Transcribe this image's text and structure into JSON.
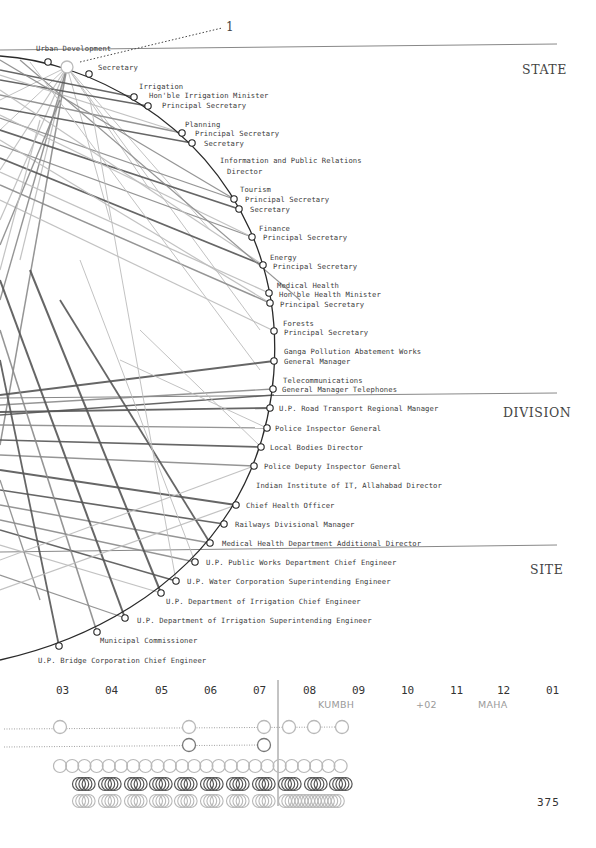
{
  "callout": {
    "number": "1"
  },
  "tiers": [
    {
      "label": "STATE",
      "x": 522,
      "y": 62
    },
    {
      "label": "DIVISION",
      "x": 503,
      "y": 405
    },
    {
      "label": "SITE",
      "x": 530,
      "y": 562
    }
  ],
  "tier_dividers": [
    {
      "x1": 0,
      "y1": 50,
      "x2": 557,
      "y2": 44
    },
    {
      "x1": 0,
      "y1": 398,
      "x2": 557,
      "y2": 393
    },
    {
      "x1": 0,
      "y1": 552,
      "x2": 557,
      "y2": 545
    }
  ],
  "nodes": [
    {
      "id": "urban_dev",
      "x": 48,
      "y": 62
    },
    {
      "id": "focus",
      "x": 67,
      "y": 67,
      "r": 6,
      "focus": true
    },
    {
      "id": "urban_sec",
      "x": 89,
      "y": 74
    },
    {
      "id": "irr_min",
      "x": 134,
      "y": 97
    },
    {
      "id": "irr_ps",
      "x": 148,
      "y": 106
    },
    {
      "id": "plan_ps",
      "x": 182,
      "y": 133
    },
    {
      "id": "plan_sec",
      "x": 192,
      "y": 143
    },
    {
      "id": "tour_ps",
      "x": 234,
      "y": 199
    },
    {
      "id": "tour_sec",
      "x": 239,
      "y": 209
    },
    {
      "id": "fin_ps",
      "x": 252,
      "y": 237
    },
    {
      "id": "energy_ps",
      "x": 263,
      "y": 265
    },
    {
      "id": "health_min",
      "x": 269,
      "y": 293
    },
    {
      "id": "health_ps",
      "x": 270,
      "y": 303
    },
    {
      "id": "forest_ps",
      "x": 274,
      "y": 331
    },
    {
      "id": "ganga_gm",
      "x": 274,
      "y": 361
    },
    {
      "id": "telecom_gm",
      "x": 273,
      "y": 389
    },
    {
      "id": "road",
      "x": 270,
      "y": 408
    },
    {
      "id": "police_ig",
      "x": 267,
      "y": 428
    },
    {
      "id": "local",
      "x": 261,
      "y": 447
    },
    {
      "id": "police_dig",
      "x": 254,
      "y": 466
    },
    {
      "id": "chief_health",
      "x": 236,
      "y": 505
    },
    {
      "id": "railways",
      "x": 224,
      "y": 524
    },
    {
      "id": "med_add",
      "x": 210,
      "y": 543
    },
    {
      "id": "pwd",
      "x": 195,
      "y": 562
    },
    {
      "id": "water",
      "x": 176,
      "y": 581
    },
    {
      "id": "irr_ce",
      "x": 161,
      "y": 593
    },
    {
      "id": "irr_se",
      "x": 125,
      "y": 618
    },
    {
      "id": "municipal",
      "x": 97,
      "y": 632
    },
    {
      "id": "bridge",
      "x": 59,
      "y": 646
    }
  ],
  "labels": [
    {
      "text": "Urban Development",
      "x": 36,
      "y": 44
    },
    {
      "text": "Secretary",
      "x": 98,
      "y": 63
    },
    {
      "text": "Irrigation",
      "x": 139,
      "y": 82
    },
    {
      "text": "Hon'ble Irrigation Minister",
      "x": 149,
      "y": 91
    },
    {
      "text": "Principal Secretary",
      "x": 162,
      "y": 101
    },
    {
      "text": "Planning",
      "x": 185,
      "y": 120
    },
    {
      "text": "Principal Secretary",
      "x": 195,
      "y": 129
    },
    {
      "text": "Secretary",
      "x": 204,
      "y": 139
    },
    {
      "text": "Information and Public Relations",
      "x": 220,
      "y": 156
    },
    {
      "text": "Director",
      "x": 227,
      "y": 167
    },
    {
      "text": "Tourism",
      "x": 240,
      "y": 185
    },
    {
      "text": "Principal Secretary",
      "x": 245,
      "y": 195
    },
    {
      "text": "Secretary",
      "x": 250,
      "y": 205
    },
    {
      "text": "Finance",
      "x": 259,
      "y": 224
    },
    {
      "text": "Principal Secretary",
      "x": 263,
      "y": 233
    },
    {
      "text": "Energy",
      "x": 270,
      "y": 253
    },
    {
      "text": "Principal Secretary",
      "x": 273,
      "y": 262
    },
    {
      "text": "Medical Health",
      "x": 277,
      "y": 281
    },
    {
      "text": "Hon'ble Health Minister",
      "x": 279,
      "y": 290
    },
    {
      "text": "Principal Secretary",
      "x": 280,
      "y": 300
    },
    {
      "text": "Forests",
      "x": 283,
      "y": 319
    },
    {
      "text": "Principal Secretary",
      "x": 284,
      "y": 328
    },
    {
      "text": "Ganga Pollution Abatement Works",
      "x": 284,
      "y": 347
    },
    {
      "text": "General Manager",
      "x": 284,
      "y": 357
    },
    {
      "text": "Telecommunications",
      "x": 283,
      "y": 376
    },
    {
      "text": "General Manager Telephones",
      "x": 282,
      "y": 385
    },
    {
      "text": "U.P. Road Transport Regional Manager",
      "x": 279,
      "y": 404
    },
    {
      "text": "Police Inspector General",
      "x": 275,
      "y": 424
    },
    {
      "text": "Local Bodies Director",
      "x": 270,
      "y": 443
    },
    {
      "text": "Police Deputy Inspector General",
      "x": 264,
      "y": 462
    },
    {
      "text": "Indian Institute of IT, Allahabad Director",
      "x": 256,
      "y": 481
    },
    {
      "text": "Chief Health Officer",
      "x": 246,
      "y": 501
    },
    {
      "text": "Railways Divisional Manager",
      "x": 235,
      "y": 520
    },
    {
      "text": "Medical Health Department Additional Director",
      "x": 222,
      "y": 539
    },
    {
      "text": "U.P. Public Works Department Chief Engineer",
      "x": 206,
      "y": 558
    },
    {
      "text": "U.P. Water Corporation Superintending Engineer",
      "x": 187,
      "y": 577
    },
    {
      "text": "U.P. Department of Irrigation Chief Engineer",
      "x": 166,
      "y": 597
    },
    {
      "text": "U.P. Department of Irrigation Superintending Engineer",
      "x": 137,
      "y": 616
    },
    {
      "text": "Municipal Commissioner",
      "x": 100,
      "y": 636
    },
    {
      "text": "U.P. Bridge Corporation Chief Engineer",
      "x": 38,
      "y": 656
    }
  ],
  "timeline": {
    "years": [
      {
        "label": "03",
        "x": 56
      },
      {
        "label": "04",
        "x": 105
      },
      {
        "label": "05",
        "x": 155
      },
      {
        "label": "06",
        "x": 204
      },
      {
        "label": "07",
        "x": 253
      },
      {
        "label": "08",
        "x": 303
      },
      {
        "label": "09",
        "x": 352
      },
      {
        "label": "10",
        "x": 401
      },
      {
        "label": "11",
        "x": 450
      },
      {
        "label": "12",
        "x": 497
      },
      {
        "label": "01",
        "x": 546
      }
    ],
    "events": [
      {
        "label": "KUMBH",
        "x": 318,
        "y": 699
      },
      {
        "label": "+02",
        "x": 416,
        "y": 699
      },
      {
        "label": "MAHA",
        "x": 478,
        "y": 699
      }
    ],
    "now_line_x": 278,
    "row1_circles": [
      60,
      189,
      264,
      289,
      314,
      342
    ],
    "row2_circles": [
      189,
      264
    ]
  },
  "page": {
    "number": "375"
  },
  "colors": {
    "arc": "#2a2a2a",
    "dark_line": "#555555",
    "mid_line": "#8a8a8a",
    "light_line": "#bbbbbb",
    "divider": "#888888",
    "light_circle": "#b8b8b8",
    "dark_circle": "#555555"
  }
}
